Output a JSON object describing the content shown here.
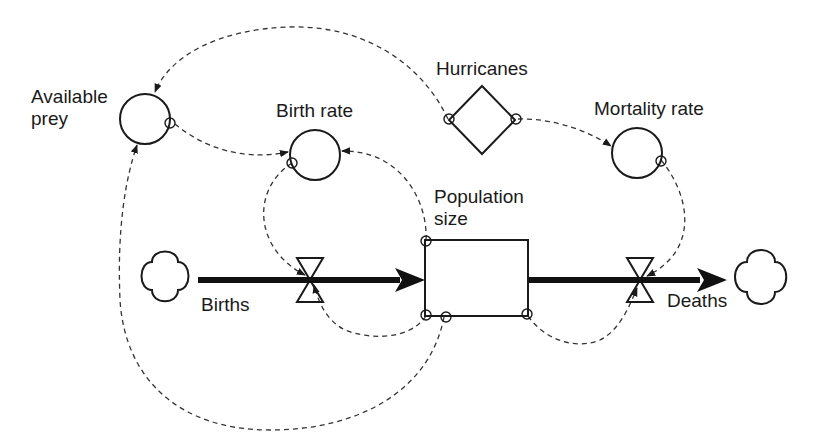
{
  "diagram": {
    "type": "stock-and-flow",
    "nodes": {
      "available_prey": {
        "label_line1": "Available",
        "label_line2": "prey",
        "kind": "converter"
      },
      "birth_rate": {
        "label": "Birth rate",
        "kind": "converter"
      },
      "hurricanes": {
        "label": "Hurricanes",
        "kind": "driving-variable"
      },
      "mortality_rate": {
        "label": "Mortality rate",
        "kind": "converter"
      },
      "population_size": {
        "label_line1": "Population",
        "label_line2": "size",
        "kind": "stock"
      },
      "births": {
        "label": "Births",
        "kind": "flow"
      },
      "deaths": {
        "label": "Deaths",
        "kind": "flow"
      },
      "source_cloud": {
        "kind": "source"
      },
      "sink_cloud": {
        "kind": "sink"
      }
    },
    "links": [
      {
        "from": "Hurricanes",
        "to": "Available prey"
      },
      {
        "from": "Available prey",
        "to": "Birth rate"
      },
      {
        "from": "Hurricanes",
        "to": "Mortality rate"
      },
      {
        "from": "Population size",
        "to": "Birth rate"
      },
      {
        "from": "Birth rate",
        "to": "Births"
      },
      {
        "from": "Population size",
        "to": "Births"
      },
      {
        "from": "Population size",
        "to": "Available prey"
      },
      {
        "from": "Mortality rate",
        "to": "Deaths"
      },
      {
        "from": "Population size",
        "to": "Deaths"
      }
    ],
    "flows": [
      {
        "from": "source cloud",
        "to": "Population size",
        "via": "Births"
      },
      {
        "from": "Population size",
        "to": "sink cloud",
        "via": "Deaths"
      }
    ],
    "colors": {
      "line": "#1a1a1a",
      "background": "#ffffff"
    }
  }
}
